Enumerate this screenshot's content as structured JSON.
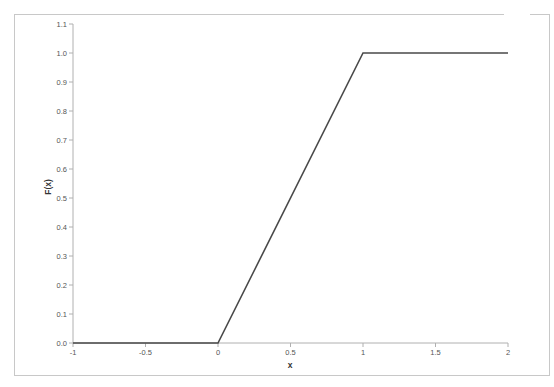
{
  "chart_data": {
    "type": "line",
    "title": "",
    "xlabel": "x",
    "ylabel": "F(x)",
    "xlim": [
      -1,
      2
    ],
    "ylim": [
      0,
      1.1
    ],
    "grid": false,
    "legend": null,
    "x_ticks": [
      "-1",
      "-0.5",
      "0",
      "0.5",
      "1",
      "1.5",
      "2"
    ],
    "y_ticks": [
      "0.0",
      "0.1",
      "0.2",
      "0.3",
      "0.4",
      "0.5",
      "0.6",
      "0.7",
      "0.8",
      "0.9",
      "1.0",
      "1.1"
    ],
    "series": [
      {
        "name": "F(x)",
        "color": "#4a4a4a",
        "x": [
          -1,
          0,
          1,
          2
        ],
        "y": [
          0,
          0,
          1,
          1
        ]
      }
    ]
  },
  "labels": {
    "xlabel": "x",
    "ylabel": "F(x)"
  },
  "colors": {
    "line": "#4a4a4a",
    "axis": "#b0b0b0",
    "frame": "#c8c8c8",
    "tick_text": "#555555"
  }
}
